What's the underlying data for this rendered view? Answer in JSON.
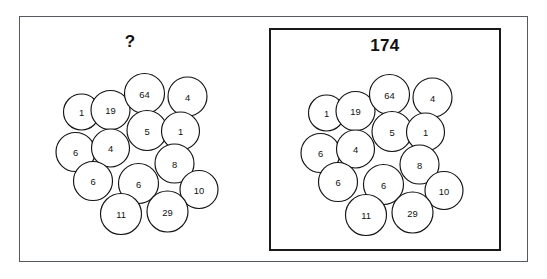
{
  "figure": {
    "type": "puzzle-diagram"
  },
  "left_cluster": {
    "label": "?",
    "label_name": "question-mark-label"
  },
  "right_cluster": {
    "label": "174",
    "label_name": "total-value-label"
  },
  "circles": [
    {
      "value": "1",
      "cx": 81.5,
      "cy": 112.0,
      "r": 18.0
    },
    {
      "value": "19",
      "cx": 110.5,
      "cy": 110.0,
      "r": 19.5
    },
    {
      "value": "64",
      "cx": 144.5,
      "cy": 93.5,
      "r": 20.0
    },
    {
      "value": "4",
      "cx": 187.5,
      "cy": 96.5,
      "r": 19.5
    },
    {
      "value": "5",
      "cx": 147.0,
      "cy": 130.5,
      "r": 20.0
    },
    {
      "value": "1",
      "cx": 180.5,
      "cy": 131.0,
      "r": 19.0
    },
    {
      "value": "6",
      "cx": 75.5,
      "cy": 152.0,
      "r": 19.5
    },
    {
      "value": "4",
      "cx": 110.5,
      "cy": 148.0,
      "r": 19.0
    },
    {
      "value": "8",
      "cx": 174.5,
      "cy": 163.5,
      "r": 19.5
    },
    {
      "value": "6",
      "cx": 93.0,
      "cy": 181.0,
      "r": 19.5
    },
    {
      "value": "6",
      "cx": 138.5,
      "cy": 183.5,
      "r": 20.0
    },
    {
      "value": "10",
      "cx": 199.0,
      "cy": 189.5,
      "r": 19.0
    },
    {
      "value": "11",
      "cx": 121.0,
      "cy": 214.0,
      "r": 20.5
    },
    {
      "value": "29",
      "cx": 167.5,
      "cy": 211.5,
      "r": 20.5
    }
  ],
  "layout": {
    "right_cluster_offset_x": 245,
    "right_cluster_offset_y": 1
  },
  "chart_data": {
    "type": "table",
    "categories": [
      "1",
      "19",
      "64",
      "4",
      "5",
      "1",
      "6",
      "4",
      "8",
      "6",
      "6",
      "10",
      "11",
      "29"
    ],
    "values": [
      1,
      19,
      64,
      4,
      5,
      1,
      6,
      4,
      8,
      6,
      6,
      10,
      11,
      29
    ],
    "annotations": [
      "?",
      "174"
    ],
    "total": 174
  }
}
